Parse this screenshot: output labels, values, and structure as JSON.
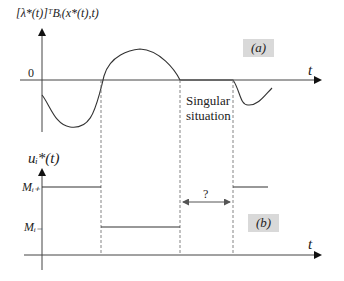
{
  "top_panel": {
    "y_axis_label": "[λ*(t)]ᵀBᵢ(x*(t),t)",
    "zero_label": "0",
    "t_label": "t",
    "tag": "(a)",
    "annotation_line1": "Singular",
    "annotation_line2": "situation"
  },
  "bottom_panel": {
    "y_axis_label": "uᵢ*(t)",
    "upper_level_label": "Mᵢ₊",
    "lower_level_label": "Mᵢ₋",
    "t_label": "t",
    "tag": "(b)",
    "interval_label": "?"
  }
}
